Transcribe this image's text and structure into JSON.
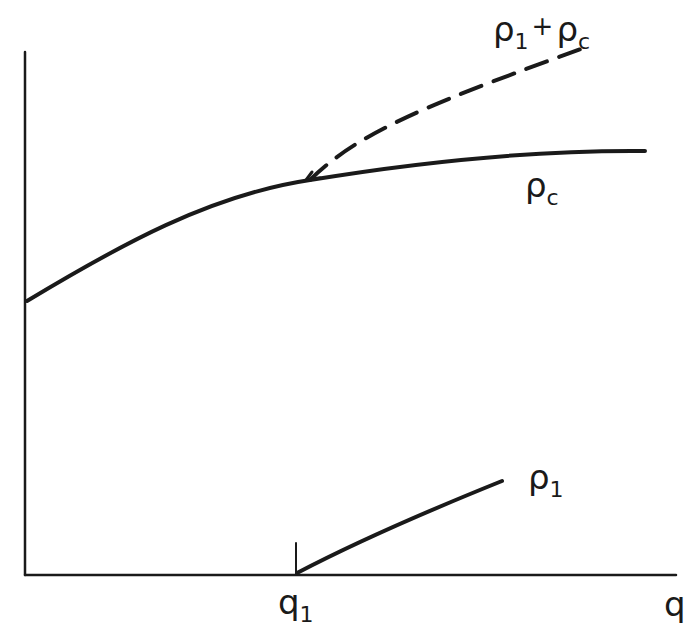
{
  "diagram": {
    "axes": {
      "x_label": "q",
      "y_label": "",
      "x_tick": {
        "label_base": "q",
        "label_sub": "1"
      }
    },
    "curves": [
      {
        "id": "rho_c",
        "label_base": "ρ",
        "label_sub": "c",
        "style": "solid",
        "description": "rising concave curve from y-axis leveling off"
      },
      {
        "id": "rho_1_plus_rho_c",
        "label_base": "ρ",
        "label_sub": "1",
        "label_plus": "+",
        "label_base2": "ρ",
        "label_sub2": "c",
        "style": "dashed",
        "description": "dashed branch starting at q1 on rho_c curve, rising above it"
      },
      {
        "id": "rho_1",
        "label_base": "ρ",
        "label_sub": "1",
        "style": "solid",
        "description": "line starting at q1 on x-axis, rising linearly"
      }
    ],
    "colors": {
      "ink": "#1a1a1a",
      "background": "#ffffff"
    }
  }
}
